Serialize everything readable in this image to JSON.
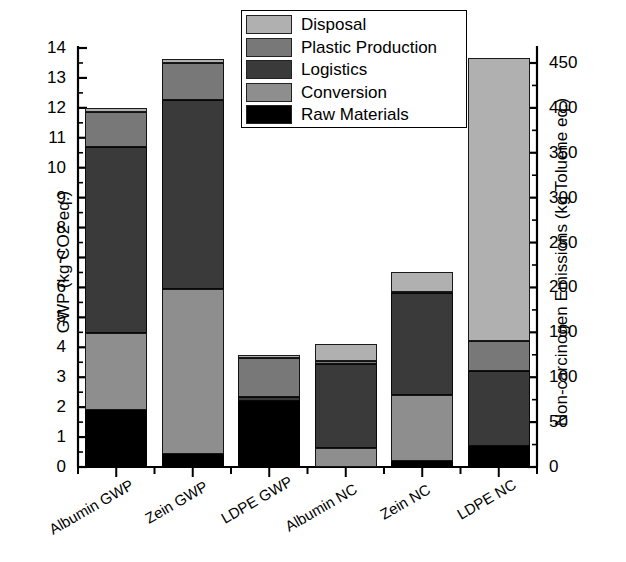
{
  "chart_data": {
    "type": "bar",
    "stacked": true,
    "title": "",
    "categories": [
      "Albumin GWP",
      "Zein GWP",
      "LDPE GWP",
      "Albumin NC",
      "Zein NC",
      "LDPE NC"
    ],
    "series": [
      {
        "name": "Raw Materials",
        "color": "#000000",
        "values": [
          1.9,
          0.45,
          2.2,
          0.0,
          0.2,
          0.7
        ]
      },
      {
        "name": "Conversion",
        "color": "#8e8e8e",
        "values": [
          2.58,
          5.5,
          0.0,
          0.65,
          2.2,
          0.0
        ]
      },
      {
        "name": "Logistics",
        "color": "#3a3a3a",
        "values": [
          6.22,
          6.3,
          0.15,
          2.8,
          3.4,
          2.5
        ]
      },
      {
        "name": "Plastic Production",
        "color": "#787878",
        "values": [
          1.15,
          1.25,
          1.3,
          0.1,
          0.05,
          1.0
        ]
      },
      {
        "name": "Disposal",
        "color": "#b0b0b0",
        "values": [
          0.13,
          0.12,
          0.08,
          0.55,
          0.65,
          9.45
        ]
      }
    ],
    "totals": [
      11.98,
      13.62,
      3.73,
      4.1,
      6.5,
      13.65
    ],
    "left_axis": {
      "label": "GWP (kg CO2 eq.)",
      "min": 0,
      "max": 14,
      "step": 1,
      "ticks": [
        "0",
        "1",
        "2",
        "3",
        "4",
        "5",
        "6",
        "7",
        "8",
        "9",
        "10",
        "11",
        "12",
        "13",
        "14"
      ]
    },
    "right_axis": {
      "label": "Non-carcinogen Emissions (kg Toluene eq.)",
      "min": 0,
      "max": 466.7,
      "step": 50,
      "ticks": [
        "0",
        "50",
        "100",
        "150",
        "200",
        "250",
        "300",
        "350",
        "400",
        "450"
      ]
    },
    "xlabel": "",
    "grid": false,
    "legend": {
      "position": "top-center",
      "entries": [
        "Disposal",
        "Plastic Production",
        "Logistics",
        "Conversion",
        "Raw Materials"
      ]
    }
  },
  "legend": {
    "items": [
      {
        "label": "Disposal",
        "color": "#b0b0b0"
      },
      {
        "label": "Plastic Production",
        "color": "#787878"
      },
      {
        "label": "Logistics",
        "color": "#3a3a3a"
      },
      {
        "label": "Conversion",
        "color": "#8e8e8e"
      },
      {
        "label": "Raw Materials",
        "color": "#000000"
      }
    ]
  },
  "axes": {
    "left_title": "GWP (kg CO2 eq.)",
    "right_title": "Non-carcinogen Emissions (kg Toluene eq.)",
    "left_ticks": [
      "14",
      "13",
      "12",
      "11",
      "10",
      "9",
      "8",
      "7",
      "6",
      "5",
      "4",
      "3",
      "2",
      "1",
      "0"
    ],
    "right_ticks": [
      "450",
      "400",
      "350",
      "300",
      "250",
      "200",
      "150",
      "100",
      "50",
      "0"
    ],
    "x_ticks": [
      "Albumin GWP",
      "Zein GWP",
      "LDPE GWP",
      "Albumin NC",
      "Zein NC",
      "LDPE NC"
    ]
  }
}
